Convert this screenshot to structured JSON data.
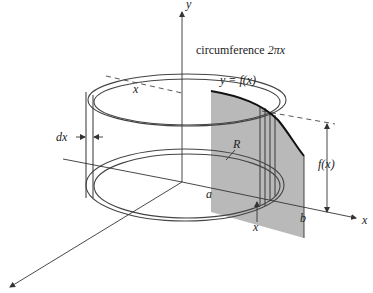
{
  "figure": {
    "type": "shell-method-volume-of-revolution",
    "labels": {
      "y_axis": "y",
      "x_axis": "x",
      "circumference": "circumference 2πx",
      "circumference_prefix": "circumference ",
      "circumference_expr": "2πx",
      "radius_x": "x",
      "thickness": "dx",
      "function": "y = f(x)",
      "region": "R",
      "height": "f(x)",
      "lower_bound": "a",
      "upper_bound": "b",
      "shell_position": "x"
    },
    "colors": {
      "background": "#ffffff",
      "region_fill": "#b9b9b9",
      "line": "#333333",
      "curve": "#111111"
    }
  }
}
